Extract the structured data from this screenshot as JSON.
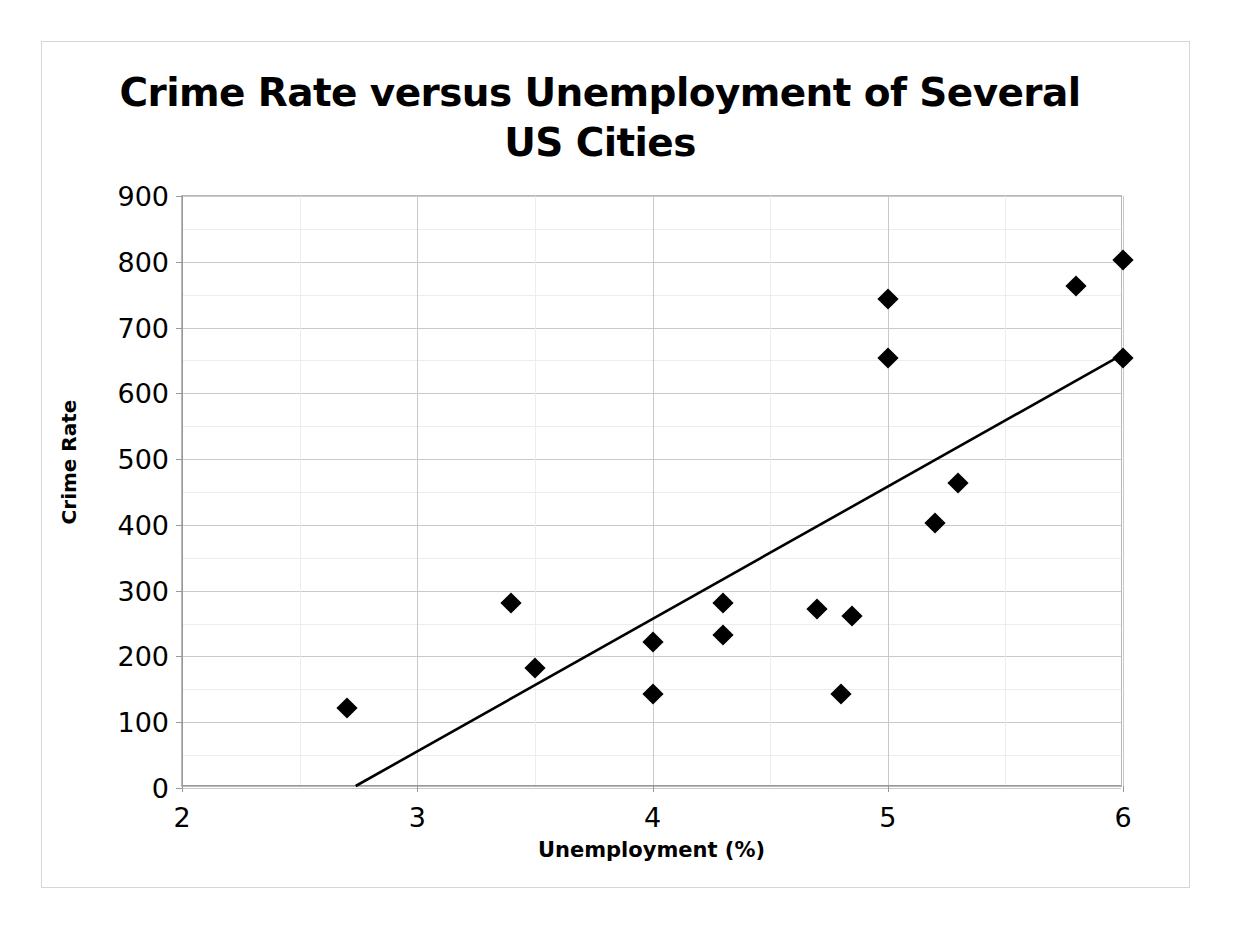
{
  "chart_data": {
    "type": "scatter",
    "title": "Crime Rate versus Unemployment of Several\nUS Cities",
    "xlabel": "Unemployment (%)",
    "ylabel": "Crime Rate",
    "xlim": [
      2,
      6
    ],
    "ylim": [
      0,
      900
    ],
    "xticks": [
      2,
      3,
      4,
      5,
      6
    ],
    "yticks": [
      0,
      100,
      200,
      300,
      400,
      500,
      600,
      700,
      800,
      900
    ],
    "xtick_labels": [
      "2",
      "3",
      "4",
      "5",
      "6"
    ],
    "ytick_labels": [
      "0",
      "100",
      "200",
      "300",
      "400",
      "500",
      "600",
      "700",
      "800",
      "900"
    ],
    "x_minor_step": 0.5,
    "y_minor_step": 50,
    "grid": true,
    "legend": false,
    "marker": "diamond",
    "marker_color": "#000000",
    "points": [
      {
        "x": 2.7,
        "y": 122
      },
      {
        "x": 3.4,
        "y": 282
      },
      {
        "x": 3.5,
        "y": 182
      },
      {
        "x": 4.0,
        "y": 222
      },
      {
        "x": 4.0,
        "y": 143
      },
      {
        "x": 4.3,
        "y": 282
      },
      {
        "x": 4.3,
        "y": 232
      },
      {
        "x": 4.7,
        "y": 272
      },
      {
        "x": 4.8,
        "y": 143
      },
      {
        "x": 4.85,
        "y": 262
      },
      {
        "x": 5.0,
        "y": 743
      },
      {
        "x": 5.0,
        "y": 653
      },
      {
        "x": 5.2,
        "y": 403
      },
      {
        "x": 5.3,
        "y": 463
      },
      {
        "x": 5.8,
        "y": 763
      },
      {
        "x": 6.0,
        "y": 803
      },
      {
        "x": 6.0,
        "y": 653
      }
    ],
    "trendline": {
      "type": "linear",
      "color": "#000000",
      "x_start": 2.74,
      "y_start": 0,
      "x_end": 6.0,
      "y_end": 657
    }
  }
}
